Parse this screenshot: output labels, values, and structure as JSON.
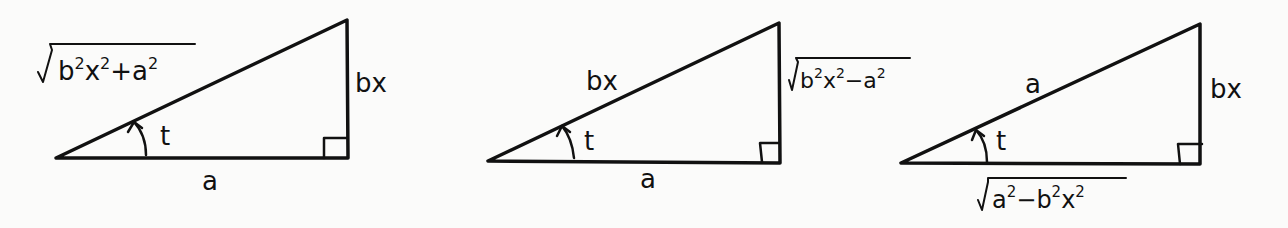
{
  "diagram": {
    "type": "right-triangle-substitutions",
    "colors": {
      "stroke": "#111111",
      "background": "#fbfbfa"
    },
    "triangles": [
      {
        "id": "triangle-1",
        "angle_label": "t",
        "hypotenuse": "√(b²x² + a²)",
        "hyp_radicand_parts": [
          "b",
          "2",
          "x",
          "2",
          "+a",
          "2"
        ],
        "opposite": "bx",
        "adjacent": "a"
      },
      {
        "id": "triangle-2",
        "angle_label": "t",
        "hypotenuse": "bx",
        "opposite": "√(b²x² − a²)",
        "opp_radicand_parts": [
          "b",
          "2",
          "x",
          "2",
          "−a",
          "2"
        ],
        "adjacent": "a"
      },
      {
        "id": "triangle-3",
        "angle_label": "t",
        "hypotenuse": "a",
        "opposite": "bx",
        "adjacent": "√(a² − b²x²)",
        "adj_radicand_parts": [
          "a",
          "2",
          "−b",
          "2",
          "x",
          "2"
        ]
      }
    ]
  }
}
